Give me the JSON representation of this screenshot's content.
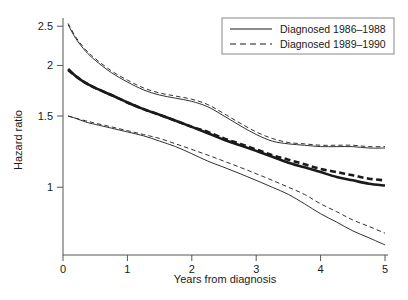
{
  "chart_data": {
    "type": "line",
    "title": "",
    "xlabel": "Years from diagnosis",
    "ylabel": "Hazard ratio",
    "xlim": [
      0,
      5
    ],
    "ylim": [
      0.68,
      2.62
    ],
    "yscale": "log",
    "grid": false,
    "xticks": [
      "0",
      "1",
      "2",
      "3",
      "4",
      "5"
    ],
    "xtick_values": [
      0,
      1,
      2,
      3,
      4,
      5
    ],
    "yticks": [
      "1",
      "1.5",
      "2",
      "2.5"
    ],
    "ytick_values": [
      1,
      1.5,
      2,
      2.5
    ],
    "legend": {
      "position": "top-right",
      "boxed": true,
      "entries": [
        {
          "label": "Diagnosed 1986–1988",
          "style": "solid"
        },
        {
          "label": "Diagnosed 1989–1990",
          "style": "dashed"
        }
      ]
    },
    "series": [
      {
        "name": "Diagnosed 1986–1988 central estimate",
        "style": "solid",
        "width": "thick",
        "role": "estimate",
        "x": [
          0.08,
          0.2,
          0.35,
          0.5,
          0.75,
          1.0,
          1.25,
          1.5,
          1.75,
          2.0,
          2.25,
          2.5,
          2.75,
          3.0,
          3.25,
          3.5,
          3.75,
          4.0,
          4.25,
          4.5,
          4.75,
          5.0
        ],
        "y": [
          1.96,
          1.88,
          1.81,
          1.76,
          1.69,
          1.62,
          1.56,
          1.51,
          1.46,
          1.41,
          1.36,
          1.31,
          1.27,
          1.23,
          1.19,
          1.15,
          1.12,
          1.09,
          1.06,
          1.04,
          1.02,
          1.01
        ]
      },
      {
        "name": "Diagnosed 1989–1990 central estimate",
        "style": "dashed",
        "width": "thick",
        "role": "estimate",
        "x": [
          0.08,
          0.2,
          0.35,
          0.5,
          0.75,
          1.0,
          1.25,
          1.5,
          1.75,
          2.0,
          2.25,
          2.5,
          2.75,
          3.0,
          3.25,
          3.5,
          3.75,
          4.0,
          4.25,
          4.5,
          4.75,
          5.0
        ],
        "y": [
          1.95,
          1.88,
          1.81,
          1.76,
          1.69,
          1.62,
          1.56,
          1.51,
          1.46,
          1.41,
          1.37,
          1.32,
          1.28,
          1.24,
          1.2,
          1.17,
          1.14,
          1.11,
          1.09,
          1.07,
          1.05,
          1.04
        ]
      },
      {
        "name": "Diagnosed 1986–1988 upper confidence limit",
        "style": "solid",
        "width": "thin",
        "role": "upper-ci",
        "x": [
          0.08,
          0.2,
          0.35,
          0.5,
          0.75,
          1.0,
          1.25,
          1.5,
          1.75,
          2.0,
          2.25,
          2.5,
          2.75,
          3.0,
          3.25,
          3.5,
          3.75,
          4.0,
          4.25,
          4.5,
          4.75,
          5.0
        ],
        "y": [
          2.52,
          2.33,
          2.17,
          2.06,
          1.92,
          1.82,
          1.74,
          1.69,
          1.66,
          1.63,
          1.58,
          1.5,
          1.42,
          1.35,
          1.3,
          1.28,
          1.27,
          1.26,
          1.26,
          1.26,
          1.25,
          1.25
        ]
      },
      {
        "name": "Diagnosed 1989–1990 upper confidence limit",
        "style": "dashed",
        "width": "thin",
        "role": "upper-ci",
        "x": [
          0.08,
          0.2,
          0.35,
          0.5,
          0.75,
          1.0,
          1.25,
          1.5,
          1.75,
          2.0,
          2.25,
          2.5,
          2.75,
          3.0,
          3.25,
          3.5,
          3.75,
          4.0,
          4.25,
          4.5,
          4.75,
          5.0
        ],
        "y": [
          2.54,
          2.35,
          2.19,
          2.08,
          1.94,
          1.84,
          1.76,
          1.71,
          1.68,
          1.65,
          1.6,
          1.52,
          1.44,
          1.37,
          1.32,
          1.29,
          1.28,
          1.27,
          1.27,
          1.27,
          1.26,
          1.26
        ]
      },
      {
        "name": "Diagnosed 1986–1988 lower confidence limit",
        "style": "solid",
        "width": "thin",
        "role": "lower-ci",
        "x": [
          0.08,
          0.2,
          0.35,
          0.5,
          0.75,
          1.0,
          1.25,
          1.5,
          1.75,
          2.0,
          2.25,
          2.5,
          2.75,
          3.0,
          3.25,
          3.5,
          3.75,
          4.0,
          4.25,
          4.5,
          4.75,
          5.0
        ],
        "y": [
          1.5,
          1.48,
          1.45,
          1.43,
          1.4,
          1.37,
          1.34,
          1.3,
          1.26,
          1.21,
          1.16,
          1.12,
          1.08,
          1.04,
          1.0,
          0.96,
          0.91,
          0.86,
          0.82,
          0.78,
          0.75,
          0.72
        ]
      },
      {
        "name": "Diagnosed 1989–1990 lower confidence limit",
        "style": "dashed",
        "width": "thin",
        "role": "lower-ci",
        "x": [
          0.08,
          0.2,
          0.35,
          0.5,
          0.75,
          1.0,
          1.25,
          1.5,
          1.75,
          2.0,
          2.25,
          2.5,
          2.75,
          3.0,
          3.25,
          3.5,
          3.75,
          4.0,
          4.25,
          4.5,
          4.75,
          5.0
        ],
        "y": [
          1.5,
          1.48,
          1.46,
          1.44,
          1.41,
          1.38,
          1.35,
          1.32,
          1.28,
          1.24,
          1.2,
          1.16,
          1.12,
          1.08,
          1.04,
          1.0,
          0.96,
          0.91,
          0.87,
          0.83,
          0.8,
          0.77
        ]
      }
    ]
  },
  "colors": {
    "ink": "#1a1a1a",
    "axis": "#555555",
    "background": "#ffffff",
    "legend_border": "#888888"
  }
}
